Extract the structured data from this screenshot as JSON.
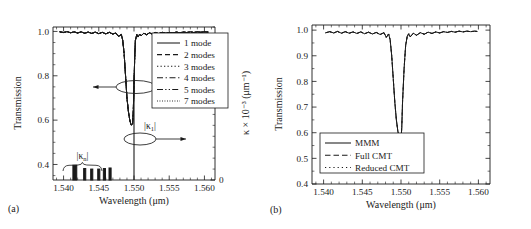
{
  "figure": {
    "panels": [
      {
        "id": "a",
        "label": "(a)",
        "xlabel": "Wavelength (μm)",
        "ylabel": "Transmission",
        "y2label": "κ × 10⁻³ (μm⁻¹)",
        "xticks": [
          "1.540",
          "1.545",
          "1.550",
          "1.555",
          "1.560"
        ],
        "xtickvals": [
          1.54,
          1.545,
          1.55,
          1.555,
          1.56
        ],
        "yticks": [
          "0.4",
          "0.6",
          "0.8",
          "1.0"
        ],
        "ytickvals": [
          0.4,
          0.6,
          0.8,
          1.0
        ],
        "y2ticks": [
          "0",
          "1"
        ],
        "y2tickvals": [
          0,
          1
        ],
        "xlim": [
          1.5385,
          1.5615
        ],
        "ylim": [
          0.33,
          1.02
        ],
        "y2lim": [
          0,
          1.4
        ],
        "legend": [
          {
            "label": "1 mode",
            "dash": "none"
          },
          {
            "label": "2 modes",
            "dash": "5,3"
          },
          {
            "label": "3 modes",
            "dash": "1.3,2.2"
          },
          {
            "label": "4 modes",
            "dash": "6,2.6,1.3,2.6"
          },
          {
            "label": "5 modes",
            "dash": "6,2.2,1.3,2.2,1.3,2.2"
          },
          {
            "label": "7 modes",
            "dash": "0.9,1.6"
          }
        ],
        "annotations": [
          {
            "name": "kappa-n-label",
            "text": "|κ",
            "sub": "n",
            "text2": "|"
          },
          {
            "name": "kappa-1-label",
            "text": "|κ",
            "sub": "1",
            "text2": "|"
          }
        ]
      },
      {
        "id": "b",
        "label": "(b)",
        "xlabel": "Wavelength (μm)",
        "ylabel": "Transmission",
        "xticks": [
          "1.540",
          "1.545",
          "1.550",
          "1.555",
          "1.560"
        ],
        "xtickvals": [
          1.54,
          1.545,
          1.55,
          1.555,
          1.56
        ],
        "yticks": [
          "1.0",
          "0.9",
          "0.8",
          "0.7",
          "0.6",
          "0.5",
          "0.4"
        ],
        "ytickvals": [
          1.0,
          0.9,
          0.8,
          0.7,
          0.6,
          0.5,
          0.4
        ],
        "xlim": [
          1.5385,
          1.5615
        ],
        "ylim": [
          0.4,
          1.02
        ],
        "legend": [
          {
            "label": "MMM",
            "dash": "none"
          },
          {
            "label": "Full CMT",
            "dash": "5.5,3"
          },
          {
            "label": "Reduced CMT",
            "dash": "1.2,3"
          }
        ]
      }
    ]
  },
  "chart_data": [
    {
      "type": "line",
      "panel": "a",
      "title": "",
      "xlabel": "Wavelength (μm)",
      "ylabel": "Transmission",
      "y2label": "κ × 10⁻³ (μm⁻¹)",
      "xlim": [
        1.5385,
        1.5615
      ],
      "ylim": [
        0.33,
        1.02
      ],
      "y2lim": [
        0,
        1.4
      ],
      "grid": false,
      "legend_position": "upper right",
      "series": [
        {
          "name": "1 mode",
          "dash": "none",
          "x": [
            1.5395,
            1.54,
            1.5405,
            1.541,
            1.5415,
            1.542,
            1.5425,
            1.543,
            1.5435,
            1.544,
            1.5445,
            1.545,
            1.5455,
            1.546,
            1.5465,
            1.547,
            1.5474,
            1.5478,
            1.5482,
            1.5484,
            1.5486,
            1.5488,
            1.549,
            1.5492,
            1.5494,
            1.5496,
            1.5498,
            1.5499,
            1.55,
            1.5501,
            1.5502,
            1.5504,
            1.5506,
            1.5508,
            1.551,
            1.5514,
            1.5518,
            1.5522,
            1.5526,
            1.553,
            1.5535,
            1.554,
            1.5545,
            1.555,
            1.5555,
            1.556,
            1.5565,
            1.557,
            1.5575,
            1.558,
            1.5585,
            1.559,
            1.5595,
            1.56,
            1.5605
          ],
          "y": [
            0.998,
            0.995,
            0.999,
            0.994,
            0.998,
            0.993,
            0.998,
            0.992,
            0.997,
            0.991,
            0.997,
            0.99,
            0.996,
            0.989,
            0.996,
            0.988,
            0.993,
            0.978,
            0.986,
            0.96,
            0.9,
            0.8,
            0.7,
            0.64,
            0.6,
            0.578,
            0.582,
            0.64,
            0.76,
            0.88,
            0.96,
            0.986,
            0.975,
            0.988,
            0.98,
            0.992,
            0.985,
            0.994,
            0.988,
            0.995,
            0.99,
            0.996,
            0.992,
            0.996,
            0.993,
            0.997,
            0.994,
            0.997,
            0.995,
            0.998,
            0.995,
            0.998,
            0.996,
            0.998,
            0.997
          ]
        },
        {
          "name": "2 modes",
          "dash": "5,3",
          "note": "overlaps 1 mode"
        },
        {
          "name": "3 modes",
          "dash": "1.3,2.2",
          "note": "overlaps 1 mode"
        },
        {
          "name": "4 modes",
          "dash": "6,2.6,1.3,2.6",
          "note": "overlaps 1 mode"
        },
        {
          "name": "5 modes",
          "dash": "6,2.2,1.3,2.2,1.3,2.2",
          "note": "overlaps 1 mode"
        },
        {
          "name": "7 modes",
          "dash": "0.9,1.6",
          "note": "overlaps 1 mode"
        }
      ],
      "bars": {
        "name": "|κn| coupling coefficients",
        "axis": "right",
        "x": [
          1.5416,
          1.543,
          1.544,
          1.545,
          1.5458,
          1.5466
        ],
        "values": [
          0.135,
          0.105,
          0.1,
          0.1,
          0.105,
          0.11
        ],
        "widths": [
          0.00055,
          0.0003,
          0.0003,
          0.0003,
          0.0003,
          0.0003
        ]
      },
      "spike": {
        "name": "|κ1| coupling coefficient",
        "axis": "right",
        "x": 1.55,
        "value": 0.96
      },
      "annotations": [
        {
          "text": "|κn|",
          "x": 1.5442,
          "y_axis": "right",
          "type": "brace-label"
        },
        {
          "text": "|κ1|",
          "x": 1.5512,
          "y_axis": "right",
          "type": "label"
        },
        {
          "type": "ellipse-arrow",
          "target": "transmission-dip",
          "direction": "left"
        },
        {
          "type": "ellipse-arrow",
          "target": "kappa-1-spike",
          "direction": "right"
        }
      ]
    },
    {
      "type": "line",
      "panel": "b",
      "title": "",
      "xlabel": "Wavelength (μm)",
      "ylabel": "Transmission",
      "xlim": [
        1.5385,
        1.5615
      ],
      "ylim": [
        0.4,
        1.02
      ],
      "grid": false,
      "legend_position": "lower left",
      "series": [
        {
          "name": "MMM",
          "dash": "none",
          "x": [
            1.5403,
            1.5408,
            1.5413,
            1.5418,
            1.5423,
            1.5428,
            1.5433,
            1.5438,
            1.5443,
            1.5448,
            1.5453,
            1.5458,
            1.5463,
            1.5468,
            1.5473,
            1.5478,
            1.5481,
            1.5484,
            1.5486,
            1.5488,
            1.549,
            1.5492,
            1.5494,
            1.5496,
            1.5498,
            1.5499,
            1.55,
            1.5501,
            1.5502,
            1.5504,
            1.5506,
            1.5508,
            1.551,
            1.5512,
            1.5516,
            1.552,
            1.5525,
            1.553,
            1.5535,
            1.554,
            1.5545,
            1.555,
            1.5555,
            1.556,
            1.5565,
            1.557,
            1.5575,
            1.558,
            1.5585,
            1.559,
            1.5595,
            1.5598
          ],
          "y": [
            0.99,
            0.994,
            0.989,
            0.995,
            0.988,
            0.994,
            0.988,
            0.993,
            0.987,
            0.993,
            0.986,
            0.992,
            0.985,
            0.991,
            0.983,
            0.99,
            0.972,
            0.985,
            0.962,
            0.9,
            0.81,
            0.72,
            0.65,
            0.605,
            0.578,
            0.57,
            0.574,
            0.62,
            0.72,
            0.85,
            0.94,
            0.975,
            0.986,
            0.974,
            0.988,
            0.98,
            0.99,
            0.984,
            0.992,
            0.987,
            0.993,
            0.989,
            0.994,
            0.991,
            0.995,
            0.992,
            0.996,
            0.993,
            0.996,
            0.994,
            0.996,
            0.995
          ]
        },
        {
          "name": "Full CMT",
          "dash": "5.5,3",
          "note": "overlaps MMM"
        },
        {
          "name": "Reduced CMT",
          "dash": "1.2,3",
          "note": "overlaps MMM"
        }
      ]
    }
  ]
}
